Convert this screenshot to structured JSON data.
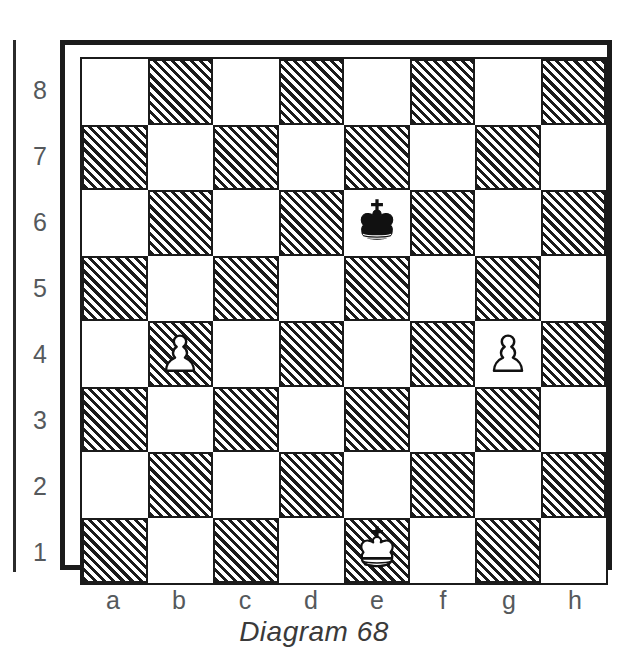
{
  "diagram": {
    "caption": "Diagram 68",
    "rank_labels": [
      "8",
      "7",
      "6",
      "5",
      "4",
      "3",
      "2",
      "1"
    ],
    "file_labels": [
      "a",
      "b",
      "c",
      "d",
      "e",
      "f",
      "g",
      "h"
    ],
    "light_square_color": "#ffffff",
    "dark_square_color": "#1b1b1b",
    "dark_square_fill": "hatched-diagonal",
    "border_color": "#1b1b1b",
    "label_color": "#55595c",
    "caption_color": "#3a3a3a"
  },
  "chart_data": {
    "type": "table",
    "title": "Diagram 68",
    "board": {
      "ranks": [
        "8",
        "7",
        "6",
        "5",
        "4",
        "3",
        "2",
        "1"
      ],
      "files": [
        "a",
        "b",
        "c",
        "d",
        "e",
        "f",
        "g",
        "h"
      ],
      "orientation": "white-bottom",
      "squares": [
        [
          "light",
          "dark",
          "light",
          "dark",
          "light",
          "dark",
          "light",
          "dark"
        ],
        [
          "dark",
          "light",
          "dark",
          "light",
          "dark",
          "light",
          "dark",
          "light"
        ],
        [
          "light",
          "dark",
          "light",
          "dark",
          "light",
          "dark",
          "light",
          "dark"
        ],
        [
          "dark",
          "light",
          "dark",
          "light",
          "dark",
          "light",
          "dark",
          "light"
        ],
        [
          "light",
          "dark",
          "light",
          "dark",
          "light",
          "dark",
          "light",
          "dark"
        ],
        [
          "dark",
          "light",
          "dark",
          "light",
          "dark",
          "light",
          "dark",
          "light"
        ],
        [
          "light",
          "dark",
          "light",
          "dark",
          "light",
          "dark",
          "light",
          "dark"
        ],
        [
          "dark",
          "light",
          "dark",
          "light",
          "dark",
          "light",
          "dark",
          "light"
        ]
      ],
      "pieces": [
        {
          "square": "e6",
          "piece": "king",
          "color": "black",
          "name": "black-king"
        },
        {
          "square": "b4",
          "piece": "pawn",
          "color": "white",
          "name": "white-pawn"
        },
        {
          "square": "g4",
          "piece": "pawn",
          "color": "white",
          "name": "white-pawn"
        },
        {
          "square": "e1",
          "piece": "king",
          "color": "white",
          "name": "white-king"
        }
      ],
      "fen": "8/8/4k3/8/1P4P1/8/8/4K3 w - - 0 1"
    }
  }
}
